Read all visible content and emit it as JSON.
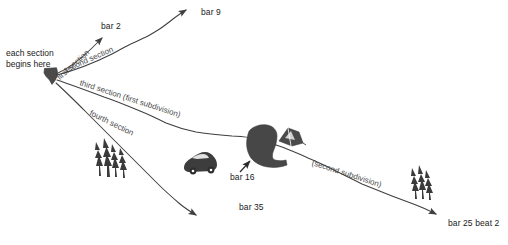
{
  "diagram": {
    "title": "each section begins here",
    "origin": {
      "label_line1": "each section",
      "label_line2": "begins here",
      "marker_name": "origin-blob"
    },
    "ink_color": "#3f3f3f",
    "fill_color": "#4a4a4a",
    "text_color": "#1a1a1a",
    "background_color": "#ffffff",
    "paths": [
      {
        "id": "first-section",
        "label": "first section",
        "endpoint_label": "bar 2",
        "rotation_deg": -42
      },
      {
        "id": "second-section",
        "label": "second section",
        "endpoint_label": "bar 9",
        "rotation_deg": -26
      },
      {
        "id": "third-section",
        "label": "third section  (first subdivision)",
        "endpoint_label": "bar 25 beat 2",
        "rotation_deg": 17
      },
      {
        "id": "fourth-section",
        "label": "fourth section",
        "endpoint_label": "bar 35",
        "rotation_deg": 25
      },
      {
        "id": "second-subdivision",
        "label": "(second subdivision)",
        "endpoint_label": "",
        "rotation_deg": 17
      }
    ],
    "annotations": [
      {
        "id": "bar-16",
        "label": "bar 16",
        "pointer": "arrow-up-right"
      }
    ],
    "icons": [
      {
        "name": "conifer-trees-left-icon"
      },
      {
        "name": "conifer-trees-right-icon"
      },
      {
        "name": "beetle-car-icon"
      },
      {
        "name": "boot-icon"
      },
      {
        "name": "tent-icon"
      }
    ]
  }
}
